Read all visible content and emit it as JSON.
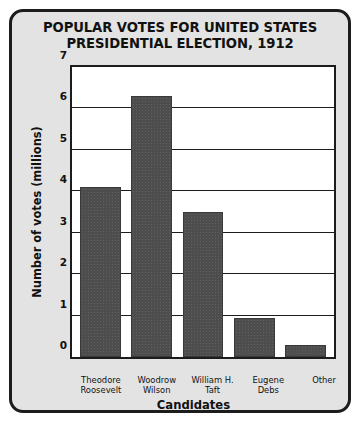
{
  "card": {
    "background_color": "#e3e3e3",
    "border_color": "#1c1c1c"
  },
  "title": {
    "line1": "POPULAR VOTES FOR UNITED STATES",
    "line2": "PRESIDENTIAL ELECTION, 1912"
  },
  "chart_data": {
    "type": "bar",
    "title": "POPULAR VOTES FOR UNITED STATES PRESIDENTIAL ELECTION, 1912",
    "xlabel": "Candidates",
    "ylabel": "Number of votes (millions)",
    "categories": [
      "Theodore Roosevelt",
      "Woodrow Wilson",
      "William H. Taft",
      "Eugene Debs",
      "Other"
    ],
    "category_lines": [
      [
        "Theodore",
        "Roosevelt"
      ],
      [
        "Woodrow",
        "Wilson"
      ],
      [
        "William H.",
        "Taft"
      ],
      [
        "Eugene",
        "Debs"
      ],
      [
        "Other"
      ]
    ],
    "values": [
      4.1,
      6.3,
      3.5,
      0.95,
      0.3
    ],
    "ylim": [
      0,
      7
    ],
    "yticks": [
      0,
      1,
      2,
      3,
      4,
      5,
      6,
      7
    ],
    "ytick_labels": [
      "0",
      "1",
      "2",
      "3",
      "4",
      "5",
      "6",
      "7"
    ],
    "grid": true,
    "legend": false,
    "bar_color": "#4d4d4d",
    "plot_background": "#ffffff",
    "axis_color": "#1c1c1c"
  }
}
